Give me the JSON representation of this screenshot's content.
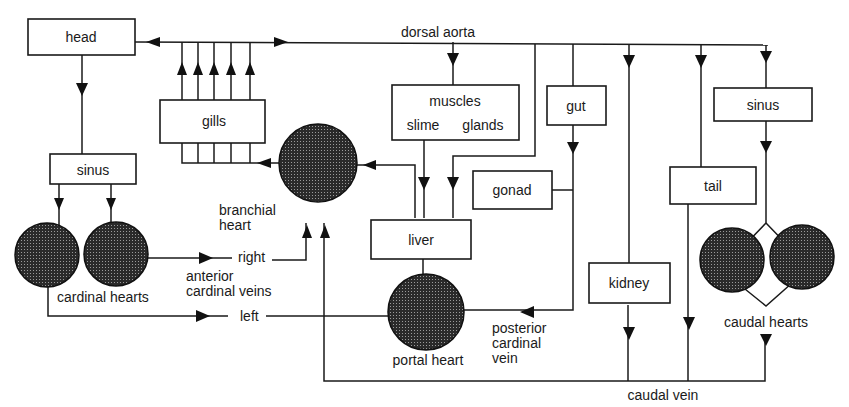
{
  "diagram": {
    "type": "circulatory-flow-diagram",
    "colors": {
      "ink": "#1a1a1a",
      "heart_fill": "#2b2b2b",
      "background": "#ffffff"
    },
    "vessels": {
      "dorsal_aorta": "dorsal aorta",
      "caudal_vein": "caudal vein",
      "right": "right",
      "left": "left",
      "anterior_cardinal_veins_1": "anterior",
      "anterior_cardinal_veins_2": "cardinal veins",
      "posterior_cardinal_vein_1": "posterior",
      "posterior_cardinal_vein_2": "cardinal",
      "posterior_cardinal_vein_3": "vein"
    },
    "organs": {
      "head": "head",
      "sinus_left": "sinus",
      "gills": "gills",
      "muscles": "muscles",
      "slime": "slime",
      "glands": "glands",
      "gut": "gut",
      "sinus_right": "sinus",
      "gonad": "gonad",
      "tail": "tail",
      "liver": "liver",
      "kidney": "kidney"
    },
    "hearts": {
      "branchial_1": "branchial",
      "branchial_2": "heart",
      "cardinal": "cardinal hearts",
      "portal": "portal heart",
      "caudal": "caudal hearts"
    }
  }
}
